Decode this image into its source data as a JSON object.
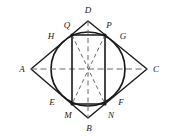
{
  "figure": {
    "name": "rhombus-with-inscribed-circle-and-rectangle",
    "background_color": "#ffffff",
    "stroke_color": "#1a1a1a",
    "dashed_color": "#5a5a5a",
    "canvas": {
      "width": 174,
      "height": 137
    }
  },
  "labels": {
    "A": "A",
    "B": "B",
    "C": "C",
    "D": "D",
    "E": "E",
    "F": "F",
    "G": "G",
    "H": "H",
    "M": "M",
    "N": "N",
    "P": "P",
    "Q": "Q"
  },
  "label_positions": {
    "A": {
      "x": 22,
      "y": 69
    },
    "B": {
      "x": 89,
      "y": 128
    },
    "C": {
      "x": 156,
      "y": 69
    },
    "D": {
      "x": 88,
      "y": 10
    },
    "E": {
      "x": 52,
      "y": 102
    },
    "F": {
      "x": 121,
      "y": 102
    },
    "G": {
      "x": 123,
      "y": 36
    },
    "H": {
      "x": 51,
      "y": 36
    },
    "M": {
      "x": 68,
      "y": 115
    },
    "N": {
      "x": 111,
      "y": 115
    },
    "P": {
      "x": 109,
      "y": 25
    },
    "Q": {
      "x": 67,
      "y": 25
    }
  },
  "geometry": {
    "rhombus": {
      "name": "rhombus-ABCD",
      "vertices": [
        {
          "id": "A",
          "x": 31,
          "y": 69
        },
        {
          "id": "D",
          "x": 88,
          "y": 21
        },
        {
          "id": "C",
          "x": 147,
          "y": 69
        },
        {
          "id": "B",
          "x": 88,
          "y": 118
        }
      ]
    },
    "circle": {
      "name": "inscribed-circle",
      "cx": 88,
      "cy": 69,
      "r": 37
    },
    "rectangle": {
      "name": "inscribed-rectangle-QPNM",
      "vertices": [
        {
          "id": "Q",
          "x": 72,
          "y": 35
        },
        {
          "id": "P",
          "x": 105,
          "y": 35
        },
        {
          "id": "N",
          "x": 105,
          "y": 104
        },
        {
          "id": "M",
          "x": 72,
          "y": 104
        }
      ]
    },
    "tangent_points": [
      {
        "id": "H",
        "x": 60,
        "y": 44
      },
      {
        "id": "G",
        "x": 115,
        "y": 44
      },
      {
        "id": "F",
        "x": 115,
        "y": 95
      },
      {
        "id": "E",
        "x": 60,
        "y": 95
      }
    ],
    "diagonals_dashed": [
      {
        "name": "diagonal-A-C",
        "x1": 31,
        "y1": 69,
        "x2": 147,
        "y2": 69
      },
      {
        "name": "diagonal-D-B",
        "x1": 88,
        "y1": 21,
        "x2": 88,
        "y2": 118
      },
      {
        "name": "rect-diagonal-Q-N",
        "x1": 72,
        "y1": 35,
        "x2": 105,
        "y2": 104
      },
      {
        "name": "rect-diagonal-P-M",
        "x1": 105,
        "y1": 35,
        "x2": 72,
        "y2": 104
      }
    ]
  }
}
